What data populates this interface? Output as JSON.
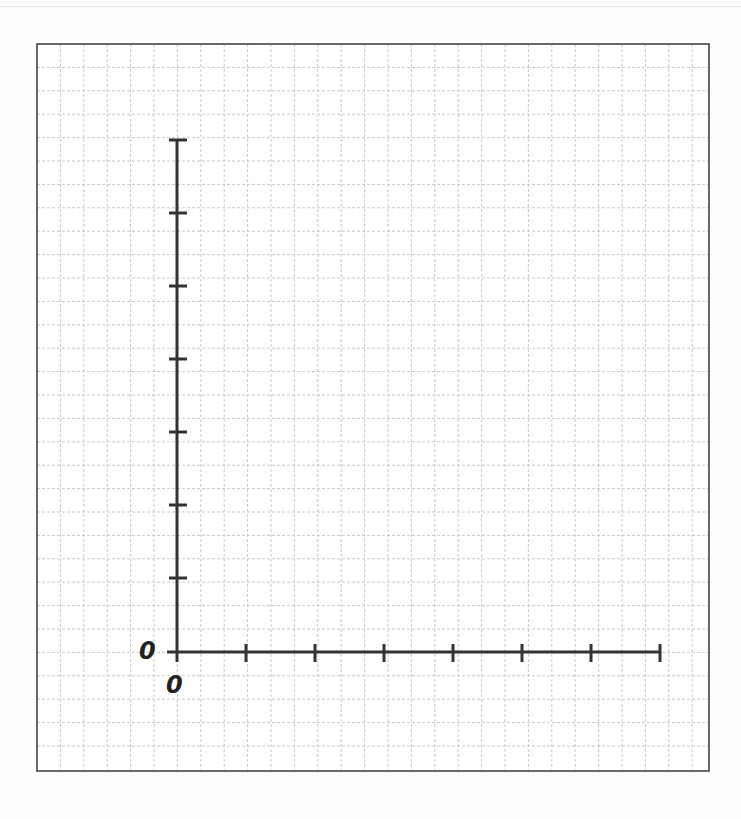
{
  "chart_data": {
    "type": "line",
    "title": "",
    "xlabel": "",
    "ylabel": "",
    "x_ticks": [
      0,
      "",
      "",
      "",
      "",
      "",
      "",
      ""
    ],
    "y_ticks": [
      0,
      "",
      "",
      "",
      "",
      "",
      "",
      ""
    ],
    "x_tick_count": 8,
    "y_tick_count": 8,
    "series": [],
    "grid": true,
    "note": "Blank coordinate axes on graph paper; only origin labeled 0 on both axes"
  },
  "labels": {
    "y_origin": "0",
    "x_origin": "0"
  },
  "colors": {
    "axis": "#333333",
    "frame": "#444444",
    "grid": "#c8c8c8",
    "background": "#ffffff"
  },
  "layout": {
    "frame": {
      "x": 37,
      "y": 44,
      "w": 672,
      "h": 727
    },
    "grid_cell": 23.4,
    "origin": {
      "x": 177,
      "y": 652
    },
    "x_tick_positions": [
      177,
      246,
      315,
      384,
      453,
      522,
      591,
      660
    ],
    "y_tick_positions": [
      652,
      578,
      505,
      432,
      359,
      286,
      213,
      140
    ]
  }
}
